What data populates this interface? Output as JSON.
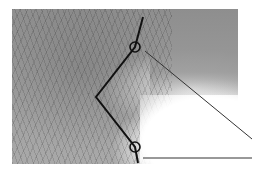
{
  "figure": {
    "photo": {
      "x": 12,
      "y": 9,
      "width": 226,
      "height": 155
    },
    "colors": {
      "line": "#111111",
      "thin_line": "#333333",
      "background": "#ffffff"
    },
    "bent_line": {
      "points": [
        [
          143,
          17
        ],
        [
          135,
          47
        ],
        [
          96,
          97
        ],
        [
          135,
          147
        ],
        [
          138,
          163
        ]
      ]
    },
    "joints": [
      {
        "name": "upper-joint",
        "cx": 135,
        "cy": 47,
        "r": 5
      },
      {
        "name": "lower-joint",
        "cx": 135,
        "cy": 147,
        "r": 5
      }
    ],
    "diagonal_line": {
      "x1": 145,
      "y1": 51,
      "x2": 252,
      "y2": 139
    },
    "horizontal_line": {
      "x1": 143,
      "y1": 158,
      "x2": 252,
      "y2": 158
    }
  }
}
